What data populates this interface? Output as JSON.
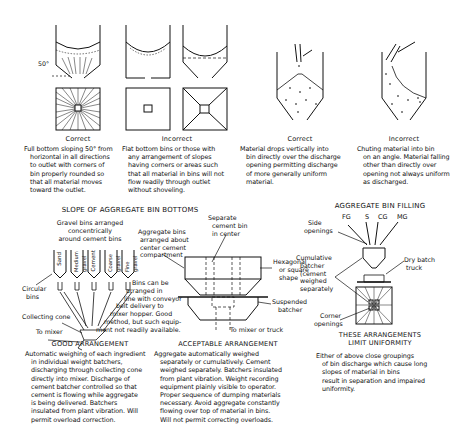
{
  "slope_section": {
    "title": "SLOPE OF AGGREGATE BIN BOTTOMS",
    "angle_label": "50°",
    "panels": [
      {
        "verdict": "Correct",
        "lines": [
          "Full bottom sloping 50° from",
          "horizontal in all directions",
          "to outlet with corners of",
          "bin properly rounded so",
          "that all material moves",
          "toward the outlet."
        ]
      },
      {
        "verdict": "Incorrect",
        "lines": [
          "Flat bottom bins or those with",
          "any arrangement of slopes",
          "having corners or areas such",
          "that all material in bins will not",
          "flow readily through outlet",
          "without shoveling."
        ]
      },
      {
        "verdict": "Correct",
        "lines": [
          "Material drops vertically into",
          "bin directly over the discharge",
          "opening permitting discharge",
          "of more generally uniform",
          "material."
        ]
      },
      {
        "verdict": "Incorrect",
        "lines": [
          "Chuting material into bin",
          "on an angle. Material falling",
          "other than directly over",
          "opening not always uniform",
          "as discharged."
        ]
      }
    ]
  },
  "good_arrangement": {
    "title": "GOOD ARRANGEMENT",
    "labels": {
      "gravel_bins": [
        "Gravel bins arranged",
        "concentrically",
        "around cement bins"
      ],
      "circular_bins": [
        "Circular",
        "bins"
      ],
      "collecting_cone": "Collecting cone",
      "to_mixer": "To mixer",
      "bins_inline": [
        "Bins can be",
        "arranged in",
        "line with conveyor",
        "belt delivery to",
        "mixer hopper. Good",
        "method, but such equip-",
        "ment not readily available."
      ]
    },
    "bins": [
      "Sand",
      "Medium gravel",
      "Cement",
      "Coarse gravel",
      "Fine gravel"
    ],
    "lines": [
      "Automatic weighing of each ingredient",
      "in individual weight batchers,",
      "discharging through collecting cone",
      "directly into mixer. Discharge of",
      "cement batcher controlled so that",
      "cement is flowing while aggregate",
      "is being delivered. Batchers",
      "insulated from plant vibration. Will",
      "permit overload correction."
    ]
  },
  "acceptable_arrangement": {
    "title": "ACCEPTABLE ARRANGEMENT",
    "labels": {
      "aggregate_bins": [
        "Aggregate bins",
        "arranged about",
        "center cement",
        "compartment"
      ],
      "separate_cement": [
        "Separate",
        "cement bin",
        "in center"
      ],
      "hexagonal": [
        "Hexagonal",
        "or square",
        "shape"
      ],
      "suspended": [
        "Suspended",
        "batcher"
      ],
      "to_mixer_truck": "To mixer or truck"
    },
    "lines": [
      "Aggregate automatically weighed",
      "separately or cumulatively. Cement",
      "weighed separately. Batchers insulated",
      "from plant vibration. Weight recording",
      "equipment plainly visible to operator.",
      "Proper sequence of dumping materials",
      "necessary. Avoid aggregate constantly",
      "flowing over top of material in bins.",
      "Will not permit correcting overloads."
    ]
  },
  "bin_filling": {
    "title": "AGGREGATE BIN FILLING",
    "chutes": [
      "FG",
      "S",
      "CG",
      "MG"
    ],
    "labels": {
      "side_openings": [
        "Side",
        "openings"
      ],
      "cumulative": [
        "Cumulative",
        "batcher",
        "(cement",
        "weighed",
        "separately"
      ],
      "dry_batch": [
        "Dry batch",
        "truck"
      ],
      "corner_openings": [
        "Corner",
        "openings"
      ]
    }
  },
  "limit_section": {
    "title_lines": [
      "THESE ARRANGEMENTS",
      "LIMIT UNIFORMITY"
    ],
    "lines": [
      "Either of above close groupings",
      "of bin discharge which cause long",
      "slopes of material in bins",
      "result in separation and impaired",
      "uniformity."
    ]
  }
}
